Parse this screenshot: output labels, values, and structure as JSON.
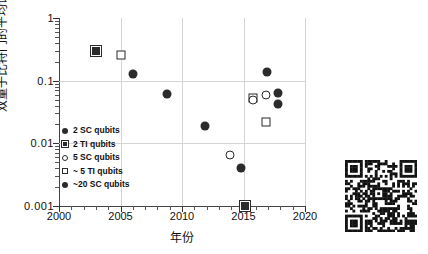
{
  "chart_data": {
    "type": "scatter",
    "title": "",
    "xlabel": "年份",
    "ylabel": "双量子比特门的平均误码率",
    "xlim": [
      2000,
      2020
    ],
    "ylim": [
      0.001,
      1
    ],
    "yscale": "log",
    "grid": true,
    "legend_position": "inside-lower-left",
    "xticks": [
      2000,
      2005,
      2010,
      2015,
      2020
    ],
    "xtick_labels": [
      "2000",
      "2005",
      "2010",
      "2015",
      "2020"
    ],
    "yticks": [
      0.001,
      0.01,
      0.1,
      1
    ],
    "ytick_labels": [
      "0.001",
      "0.01",
      "0.1",
      "1"
    ],
    "series": [
      {
        "name": "2 SC qubits",
        "marker": "circle-filled",
        "points": [
          {
            "x": 2006.0,
            "y": 0.13
          },
          {
            "x": 2008.8,
            "y": 0.062
          },
          {
            "x": 2011.9,
            "y": 0.019
          },
          {
            "x": 2014.8,
            "y": 0.004
          }
        ]
      },
      {
        "name": "2 TI qubits",
        "marker": "square-target",
        "points": [
          {
            "x": 2003.0,
            "y": 0.3
          },
          {
            "x": 2015.1,
            "y": 0.001
          }
        ]
      },
      {
        "name": "5 SC qubits",
        "marker": "circle-open",
        "points": [
          {
            "x": 2013.9,
            "y": 0.0065
          },
          {
            "x": 2015.8,
            "y": 0.05
          },
          {
            "x": 2016.8,
            "y": 0.058
          }
        ]
      },
      {
        "name": "~ 5 TI qubits",
        "marker": "square-open",
        "points": [
          {
            "x": 2005.0,
            "y": 0.26
          },
          {
            "x": 2015.8,
            "y": 0.053
          },
          {
            "x": 2016.8,
            "y": 0.022
          }
        ]
      },
      {
        "name": "~20 SC qubits",
        "marker": "circle-filled-large",
        "points": [
          {
            "x": 2016.9,
            "y": 0.135
          },
          {
            "x": 2017.8,
            "y": 0.063
          },
          {
            "x": 2017.8,
            "y": 0.043
          }
        ]
      }
    ],
    "legend_entries": [
      {
        "label": "2 SC qubits",
        "marker": "circle-filled"
      },
      {
        "label": "2 TI qubits",
        "marker": "square-target"
      },
      {
        "label": "5 SC qubits",
        "marker": "circle-open"
      },
      {
        "label": "~ 5 TI qubits",
        "marker": "square-open"
      },
      {
        "label": "~20 SC qubits",
        "marker": "circle-filled"
      }
    ],
    "all_points": [
      {
        "x": 2003.0,
        "y": 0.3,
        "marker": "square-target",
        "series": "2 TI qubits"
      },
      {
        "x": 2005.0,
        "y": 0.26,
        "marker": "square-open",
        "series": "~ 5 TI qubits"
      },
      {
        "x": 2006.0,
        "y": 0.13,
        "marker": "circle-filled",
        "series": "2 SC qubits"
      },
      {
        "x": 2008.8,
        "y": 0.062,
        "marker": "circle-filled",
        "series": "2 SC qubits"
      },
      {
        "x": 2011.9,
        "y": 0.019,
        "marker": "circle-filled",
        "series": "2 SC qubits"
      },
      {
        "x": 2013.9,
        "y": 0.0065,
        "marker": "circle-open",
        "series": "5 SC qubits"
      },
      {
        "x": 2014.8,
        "y": 0.004,
        "marker": "circle-filled",
        "series": "2 SC qubits"
      },
      {
        "x": 2015.1,
        "y": 0.001,
        "marker": "square-target",
        "series": "2 TI qubits"
      },
      {
        "x": 2015.8,
        "y": 0.053,
        "marker": "square-open",
        "series": "~ 5 TI qubits"
      },
      {
        "x": 2015.8,
        "y": 0.05,
        "marker": "circle-open",
        "series": "5 SC qubits"
      },
      {
        "x": 2016.8,
        "y": 0.058,
        "marker": "circle-open",
        "series": "5 SC qubits"
      },
      {
        "x": 2016.9,
        "y": 0.135,
        "marker": "circle-filled",
        "series": "~20 SC qubits"
      },
      {
        "x": 2016.8,
        "y": 0.022,
        "marker": "square-open",
        "series": "~ 5 TI qubits"
      },
      {
        "x": 2017.8,
        "y": 0.063,
        "marker": "circle-filled",
        "series": "~20 SC qubits"
      },
      {
        "x": 2017.8,
        "y": 0.043,
        "marker": "circle-filled",
        "series": "~20 SC qubits"
      }
    ]
  },
  "colors": {
    "marker": "#2b2b2b",
    "grid": "#d4d4d4",
    "axis": "#444444",
    "text": "#111111",
    "background": "#ffffff"
  },
  "qr_code": {
    "name": "qr-code",
    "present": true
  }
}
